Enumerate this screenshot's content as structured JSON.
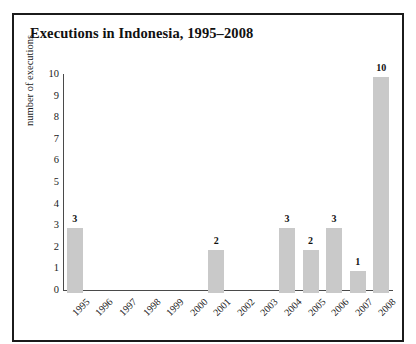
{
  "figure": {
    "title": "Executions in Indonesia, 1995–2008",
    "border_color": "#1b1b1b",
    "background": "#ffffff"
  },
  "axes": {
    "y_axis_title": "number of executions",
    "y_ticks": [
      "0",
      "1",
      "2",
      "3",
      "4",
      "5",
      "6",
      "7",
      "8",
      "9",
      "10"
    ],
    "axis_line_color": "#4a4a4a"
  },
  "chart_data": {
    "type": "bar",
    "title": "Executions in Indonesia, 1995–2008",
    "xlabel": "",
    "ylabel": "number of executions",
    "ylim": [
      0,
      10
    ],
    "yticks": [
      0,
      1,
      2,
      3,
      4,
      5,
      6,
      7,
      8,
      9,
      10
    ],
    "grid": false,
    "legend": false,
    "bar_color": "#c9c9c9",
    "data_labels": true,
    "categories": [
      "1995",
      "1996",
      "1997",
      "1998",
      "1999",
      "2000",
      "2001",
      "2002",
      "2003",
      "2004",
      "2005",
      "2006",
      "2007",
      "2008"
    ],
    "values": [
      3,
      0,
      0,
      0,
      0,
      0,
      2,
      0,
      0,
      3,
      2,
      3,
      1,
      10
    ],
    "point_labels": [
      "3",
      "",
      "",
      "",
      "",
      "",
      "2",
      "",
      "",
      "3",
      "2",
      "3",
      "1",
      "10"
    ]
  }
}
